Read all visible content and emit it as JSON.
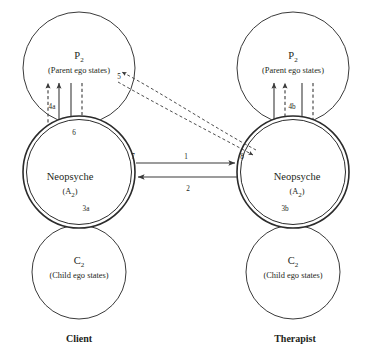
{
  "diagram": {
    "columns": [
      {
        "role_label": "Client",
        "ego_states": [
          {
            "symbol": "P",
            "subscript": "2",
            "caption": "(Parent ego states)"
          },
          {
            "symbol": "Neopsyche",
            "subscript": "",
            "caption": "(A2)"
          },
          {
            "symbol": "C",
            "subscript": "2",
            "caption": "(Child ego states)"
          }
        ]
      },
      {
        "role_label": "Therapist",
        "ego_states": [
          {
            "symbol": "P",
            "subscript": "2",
            "caption": "(Parent ego states)"
          },
          {
            "symbol": "Neopsyche",
            "subscript": "",
            "caption": "(A2)"
          },
          {
            "symbol": "C",
            "subscript": "2",
            "caption": "(Child ego states)"
          }
        ]
      }
    ],
    "labels": {
      "client_parent_symbol": "P",
      "client_parent_sub": "2",
      "client_parent_caption": "(Parent ego states)",
      "client_neopsyche": "Neopsyche",
      "client_neopsyche_caption_open": "(A",
      "client_neopsyche_caption_sub": "2",
      "client_neopsyche_caption_close": ")",
      "client_child_symbol": "C",
      "client_child_sub": "2",
      "client_child_caption": "(Child ego states)",
      "therapist_parent_symbol": "P",
      "therapist_parent_sub": "2",
      "therapist_parent_caption": "(Parent ego states)",
      "therapist_neopsyche": "Neopsyche",
      "therapist_child_symbol": "C",
      "therapist_child_sub": "2",
      "therapist_child_caption": "(Child ego states)",
      "client_role": "Client",
      "therapist_role": "Therapist"
    },
    "markers": {
      "m1": "1",
      "m2": "2",
      "m3a": "3a",
      "m3b": "3b",
      "m4a": "4a",
      "m4b": "4b",
      "m5": "5",
      "m6": "6",
      "m7": "7",
      "m8": "8"
    },
    "colors": {
      "stroke": "#3a3a3a",
      "text": "#231f20",
      "background": "#ffffff"
    }
  }
}
